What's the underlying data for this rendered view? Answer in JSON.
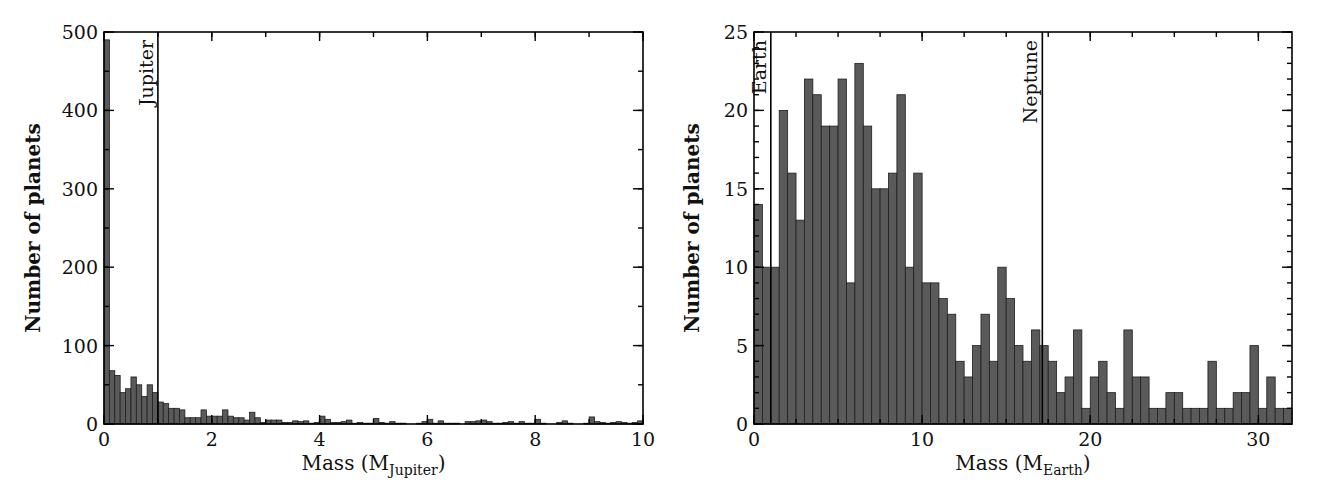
{
  "chart_data": [
    {
      "type": "bar",
      "title": "",
      "xlabel": "Mass (M_Jupiter)",
      "xlabel_main": "Mass (M",
      "xlabel_sub": "Jupiter",
      "xlabel_end": ")",
      "ylabel": "Number of planets",
      "xlim": [
        0,
        10
      ],
      "ylim": [
        0,
        500
      ],
      "bin_width": 0.1,
      "x_ticks": [
        0,
        2,
        4,
        6,
        8,
        10
      ],
      "x_tick_labels": [
        "0",
        "2",
        "4",
        "6",
        "8",
        "10"
      ],
      "x_minor_step": 1,
      "y_ticks": [
        0,
        100,
        200,
        300,
        400,
        500
      ],
      "y_tick_labels": [
        "0",
        "100",
        "200",
        "300",
        "400",
        "500"
      ],
      "y_minor_step": 50,
      "grid": false,
      "annotations": [
        {
          "label": "Jupiter",
          "x": 1.0
        }
      ],
      "bin_starts": [
        0.0,
        0.1,
        0.2,
        0.3,
        0.4,
        0.5,
        0.6,
        0.7,
        0.8,
        0.9,
        1.0,
        1.1,
        1.2,
        1.3,
        1.4,
        1.5,
        1.6,
        1.7,
        1.8,
        1.9,
        2.0,
        2.1,
        2.2,
        2.3,
        2.4,
        2.5,
        2.6,
        2.7,
        2.8,
        2.9,
        3.0,
        3.1,
        3.2,
        3.3,
        3.4,
        3.5,
        3.6,
        3.7,
        3.8,
        3.9,
        4.0,
        4.1,
        4.2,
        4.3,
        4.4,
        4.5,
        4.6,
        4.7,
        4.8,
        4.9,
        5.0,
        5.1,
        5.2,
        5.3,
        5.4,
        5.5,
        5.6,
        5.7,
        5.8,
        5.9,
        6.0,
        6.1,
        6.2,
        6.3,
        6.4,
        6.5,
        6.6,
        6.7,
        6.8,
        6.9,
        7.0,
        7.1,
        7.2,
        7.3,
        7.4,
        7.5,
        7.6,
        7.7,
        7.8,
        7.9,
        8.0,
        8.1,
        8.2,
        8.3,
        8.4,
        8.5,
        8.6,
        8.7,
        8.8,
        8.9,
        9.0,
        9.1,
        9.2,
        9.3,
        9.4,
        9.5,
        9.6,
        9.7,
        9.8,
        9.9
      ],
      "values": [
        490,
        68,
        62,
        40,
        45,
        60,
        50,
        35,
        50,
        40,
        28,
        26,
        20,
        20,
        18,
        8,
        8,
        8,
        18,
        10,
        10,
        10,
        18,
        10,
        8,
        8,
        5,
        15,
        8,
        2,
        5,
        5,
        5,
        2,
        2,
        4,
        3,
        4,
        1,
        2,
        10,
        6,
        2,
        2,
        3,
        5,
        1,
        2,
        1,
        1,
        7,
        2,
        1,
        3,
        1,
        1,
        0,
        0,
        1,
        3,
        6,
        1,
        4,
        1,
        1,
        1,
        0,
        3,
        3,
        4,
        5,
        3,
        1,
        1,
        2,
        3,
        1,
        3,
        1,
        1,
        6,
        1,
        0,
        0,
        2,
        4,
        1,
        0,
        0,
        1,
        9,
        3,
        2,
        1,
        2,
        3,
        2,
        1,
        2,
        4
      ]
    },
    {
      "type": "bar",
      "title": "",
      "xlabel": "Mass (M_Earth)",
      "xlabel_main": "Mass (M",
      "xlabel_sub": "Earth",
      "xlabel_end": ")",
      "ylabel": "Number of planets",
      "xlim": [
        0,
        32
      ],
      "ylim": [
        0,
        25
      ],
      "bin_width": 0.5,
      "x_ticks": [
        0,
        10,
        20,
        30
      ],
      "x_tick_labels": [
        "0",
        "10",
        "20",
        "30"
      ],
      "x_minor_step": 2.5,
      "y_ticks": [
        0,
        5,
        10,
        15,
        20,
        25
      ],
      "y_tick_labels": [
        "0",
        "5",
        "10",
        "15",
        "20",
        "25"
      ],
      "y_minor_step": 1,
      "grid": false,
      "annotations": [
        {
          "label": "Earth",
          "x": 1.0
        },
        {
          "label": "Neptune",
          "x": 17.15
        }
      ],
      "bin_starts": [
        0,
        0.5,
        1,
        1.5,
        2,
        2.5,
        3,
        3.5,
        4,
        4.5,
        5,
        5.5,
        6,
        6.5,
        7,
        7.5,
        8,
        8.5,
        9,
        9.5,
        10,
        10.5,
        11,
        11.5,
        12,
        12.5,
        13,
        13.5,
        14,
        14.5,
        15,
        15.5,
        16,
        16.5,
        17,
        17.5,
        18,
        18.5,
        19,
        19.5,
        20,
        20.5,
        21,
        21.5,
        22,
        22.5,
        23,
        23.5,
        24,
        24.5,
        25,
        25.5,
        26,
        26.5,
        27,
        27.5,
        28,
        28.5,
        29,
        29.5,
        30,
        30.5,
        31,
        31.5
      ],
      "values": [
        14,
        10,
        10,
        20,
        16,
        13,
        22,
        21,
        19,
        19,
        22,
        9,
        23,
        19,
        15,
        15,
        16,
        21,
        10,
        16,
        9,
        9,
        8,
        7,
        4,
        3,
        5,
        7,
        4,
        10,
        8,
        5,
        4,
        6,
        5,
        4,
        2,
        3,
        6,
        1,
        3,
        4,
        2,
        1,
        6,
        3,
        3,
        1,
        1,
        2,
        2,
        1,
        1,
        1,
        4,
        1,
        1,
        2,
        2,
        5,
        1,
        3,
        1,
        1
      ]
    }
  ]
}
